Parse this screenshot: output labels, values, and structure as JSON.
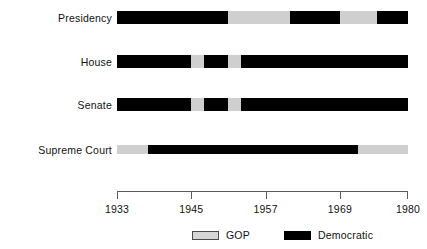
{
  "chart_data": {
    "type": "bar",
    "title": "",
    "subtitle": "",
    "xlabel": "",
    "ylabel": "",
    "orientation": "horizontal",
    "chart_style": "timeline-gantt",
    "grid": false,
    "xlim": [
      1933,
      1980
    ],
    "x_ticks": [
      1933,
      1945,
      1957,
      1969,
      1980
    ],
    "x_tick_labels": [
      "1933",
      "1945",
      "1957",
      "1969",
      "1980"
    ],
    "categories": [
      "Presidency",
      "House",
      "Senate",
      "Supreme Court"
    ],
    "legend_position": "bottom",
    "legend": [
      {
        "name": "GOP",
        "color": "#cfcfcf"
      },
      {
        "name": "Democratic",
        "color": "#000000"
      }
    ],
    "series": [
      {
        "name": "Presidency",
        "segments": [
          {
            "party": "Democratic",
            "start": 1933,
            "end": 1951
          },
          {
            "party": "GOP",
            "start": 1951,
            "end": 1961
          },
          {
            "party": "Democratic",
            "start": 1961,
            "end": 1969
          },
          {
            "party": "GOP",
            "start": 1969,
            "end": 1975
          },
          {
            "party": "Democratic",
            "start": 1975,
            "end": 1980
          }
        ]
      },
      {
        "name": "House",
        "segments": [
          {
            "party": "Democratic",
            "start": 1933,
            "end": 1945
          },
          {
            "party": "GOP",
            "start": 1945,
            "end": 1947
          },
          {
            "party": "Democratic",
            "start": 1947,
            "end": 1951
          },
          {
            "party": "GOP",
            "start": 1951,
            "end": 1953
          },
          {
            "party": "Democratic",
            "start": 1953,
            "end": 1980
          }
        ]
      },
      {
        "name": "Senate",
        "segments": [
          {
            "party": "Democratic",
            "start": 1933,
            "end": 1945
          },
          {
            "party": "GOP",
            "start": 1945,
            "end": 1947
          },
          {
            "party": "Democratic",
            "start": 1947,
            "end": 1951
          },
          {
            "party": "GOP",
            "start": 1951,
            "end": 1953
          },
          {
            "party": "Democratic",
            "start": 1953,
            "end": 1980
          }
        ]
      },
      {
        "name": "Supreme Court",
        "segments": [
          {
            "party": "GOP",
            "start": 1933,
            "end": 1938
          },
          {
            "party": "Democratic",
            "start": 1938,
            "end": 1972
          },
          {
            "party": "GOP",
            "start": 1972,
            "end": 1980
          }
        ]
      }
    ]
  },
  "row_labels": {
    "0": "Presidency",
    "1": "House",
    "2": "Senate",
    "3": "Supreme Court"
  },
  "colors": {
    "gop": "#cfcfcf",
    "democratic": "#000000",
    "axis": "#5a5a5a",
    "text": "#111111",
    "background": "#ffffff"
  }
}
